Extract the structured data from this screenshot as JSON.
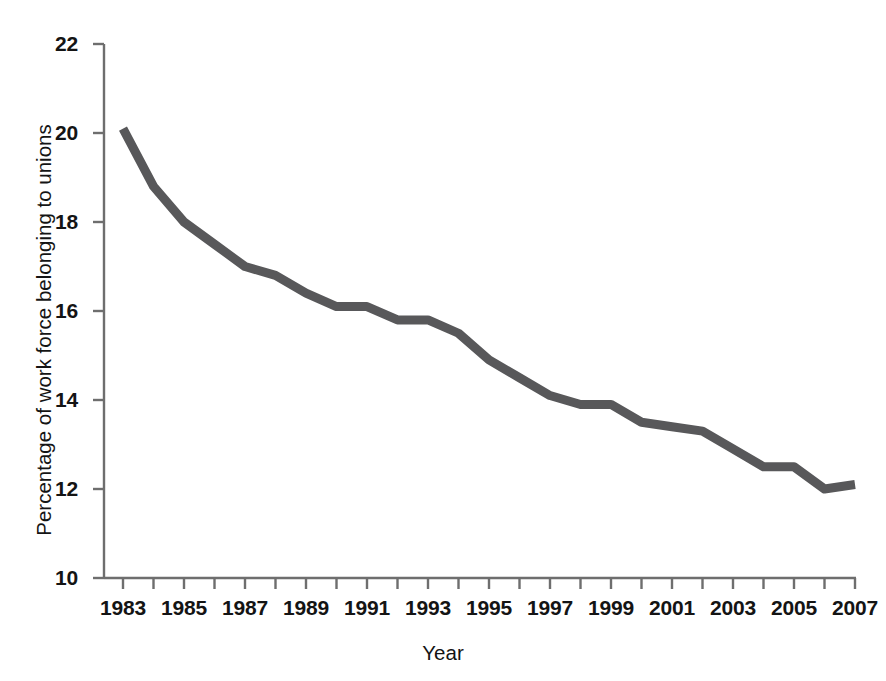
{
  "chart_data": {
    "type": "line",
    "title": "",
    "subtitle": "",
    "xlabel": "Year",
    "ylabel": "Percentage of work force belonging to unions",
    "xlim": [
      1983,
      2007
    ],
    "ylim": [
      10,
      22
    ],
    "grid": false,
    "legend": null,
    "line_color": "#58585a",
    "line_width_px": 9,
    "axis_color": "#6e6e6e",
    "background": "#ffffff",
    "x_tick_values": [
      1983,
      1984,
      1985,
      1986,
      1987,
      1988,
      1989,
      1990,
      1991,
      1992,
      1993,
      1994,
      1995,
      1996,
      1997,
      1998,
      1999,
      2000,
      2001,
      2002,
      2003,
      2004,
      2005,
      2006,
      2007
    ],
    "x_tick_labels": [
      "1983",
      "",
      "1985",
      "",
      "1987",
      "",
      "1989",
      "",
      "1991",
      "",
      "1993",
      "",
      "1995",
      "",
      "1997",
      "",
      "1999",
      "",
      "2001",
      "",
      "2003",
      "",
      "2005",
      "",
      "2007"
    ],
    "y_tick_values": [
      10,
      12,
      14,
      16,
      18,
      20,
      22
    ],
    "y_tick_labels": [
      "10",
      "12",
      "14",
      "16",
      "18",
      "20",
      "22"
    ],
    "x": [
      1983,
      1984,
      1985,
      1986,
      1987,
      1988,
      1989,
      1990,
      1991,
      1992,
      1993,
      1994,
      1995,
      1996,
      1997,
      1998,
      1999,
      2000,
      2001,
      2002,
      2003,
      2004,
      2005,
      2006,
      2007
    ],
    "values": [
      20.1,
      18.8,
      18.0,
      17.5,
      17.0,
      16.8,
      16.4,
      16.1,
      16.1,
      15.8,
      15.8,
      15.5,
      14.9,
      14.5,
      14.1,
      13.9,
      13.9,
      13.5,
      13.4,
      13.3,
      12.9,
      12.5,
      12.5,
      12.0,
      12.1
    ],
    "series": [
      {
        "name": "Percentage of work force belonging to unions",
        "values": [
          20.1,
          18.8,
          18.0,
          17.5,
          17.0,
          16.8,
          16.4,
          16.1,
          16.1,
          15.8,
          15.8,
          15.5,
          14.9,
          14.5,
          14.1,
          13.9,
          13.9,
          13.5,
          13.4,
          13.3,
          12.9,
          12.5,
          12.5,
          12.0,
          12.1
        ]
      }
    ]
  },
  "axes": {
    "y_title": "Percentage of work force belonging to unions",
    "x_title": "Year"
  }
}
